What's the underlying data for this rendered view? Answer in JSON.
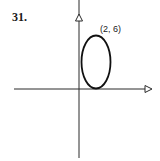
{
  "problem": {
    "number": "31."
  },
  "graph": {
    "type": "ellipse-on-axes",
    "point_label": "(2, 6)",
    "ellipse": {
      "center": [
        2,
        3
      ],
      "vertex_top": [
        2,
        6
      ],
      "tangent_to": "x-axis"
    },
    "colors": {
      "stroke": "#1a1a1a",
      "background": "#ffffff"
    }
  }
}
